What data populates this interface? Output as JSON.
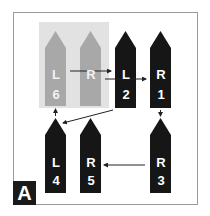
{
  "panel": {
    "label": "A"
  },
  "colors": {
    "active": "#161616",
    "inactive": "#a8a8a8",
    "highlight": "#e2e2e2",
    "arrow": "#222222"
  },
  "pieces": [
    {
      "id": "L6",
      "side": "L",
      "order": "6",
      "state": "inactive",
      "row": "top",
      "col": 1
    },
    {
      "id": "R6",
      "side": "R",
      "order": "",
      "state": "inactive",
      "row": "top",
      "col": 2
    },
    {
      "id": "L2",
      "side": "L",
      "order": "2",
      "state": "active",
      "row": "top",
      "col": 3
    },
    {
      "id": "R1",
      "side": "R",
      "order": "1",
      "state": "active",
      "row": "top",
      "col": 4
    },
    {
      "id": "L4",
      "side": "L",
      "order": "4",
      "state": "active",
      "row": "bottom",
      "col": 1
    },
    {
      "id": "R5",
      "side": "R",
      "order": "5",
      "state": "active",
      "row": "bottom",
      "col": 2
    },
    {
      "id": "R3",
      "side": "R",
      "order": "3",
      "state": "active",
      "row": "bottom",
      "col": 4
    }
  ],
  "sequence": [
    "R1",
    "L2",
    "R3",
    "L4",
    "R5",
    "L6"
  ]
}
